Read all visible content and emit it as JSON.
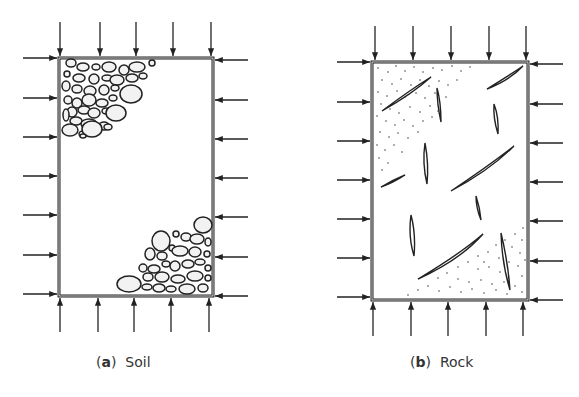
{
  "panels": [
    {
      "id": "a",
      "letter": "a",
      "label": "Soil",
      "texture": "granular particles (gravel/cobbles) in opposite corners"
    },
    {
      "id": "b",
      "letter": "b",
      "label": "Rock",
      "texture": "stippled matrix with discontinuities/fissures"
    }
  ],
  "loading": {
    "description": "Uniform compressive stress arrows on all four sides",
    "arrows_per_horizontal_side": 5,
    "arrows_per_vertical_side": 7
  },
  "colors": {
    "line": "#222222",
    "fill": "#f2f2f2",
    "background": "#ffffff"
  }
}
